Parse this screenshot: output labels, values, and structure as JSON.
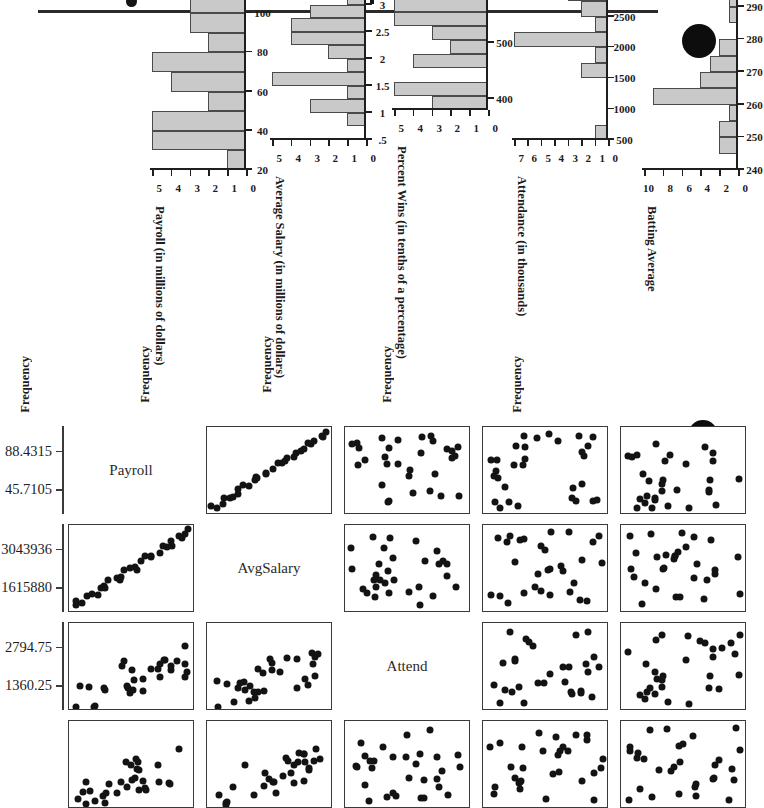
{
  "page": {
    "rule_present": true,
    "marks": [
      "page-edge-dot",
      "page-edge-dot-2",
      "stray-ink-dot"
    ]
  },
  "histograms": {
    "y_axis_title": "Frequency",
    "panels": [
      {
        "id": "payroll",
        "x_title": "Payroll (in millions of dollars)",
        "x_ticks": [
          20,
          40,
          60,
          80,
          100,
          120
        ],
        "x_min": 20,
        "x_max": 120,
        "y_ticks": [
          0,
          1,
          2,
          3,
          4,
          5
        ],
        "y_max": 5,
        "bin_width": 10,
        "bins": [
          {
            "from": 20,
            "to": 30,
            "count": 1
          },
          {
            "from": 30,
            "to": 40,
            "count": 5
          },
          {
            "from": 40,
            "to": 50,
            "count": 5
          },
          {
            "from": 50,
            "to": 60,
            "count": 2
          },
          {
            "from": 60,
            "to": 70,
            "count": 4
          },
          {
            "from": 70,
            "to": 80,
            "count": 5
          },
          {
            "from": 80,
            "to": 90,
            "count": 2
          },
          {
            "from": 90,
            "to": 100,
            "count": 3
          },
          {
            "from": 100,
            "to": 110,
            "count": 3
          },
          {
            "from": 110,
            "to": 120,
            "count": 0
          }
        ]
      },
      {
        "id": "avgsalary",
        "x_title": "Average Salary (in millions of dollars)",
        "x_ticks": [
          ".5",
          "1",
          "1.5",
          "2",
          "2.5",
          "3",
          "3.5",
          "4",
          "4.5"
        ],
        "x_min": 0.5,
        "x_max": 4.5,
        "y_ticks": [
          0,
          1,
          2,
          3,
          4,
          5
        ],
        "y_max": 5,
        "bin_width": 0.25,
        "bins": [
          {
            "from": 0.5,
            "to": 0.75,
            "count": 0
          },
          {
            "from": 0.75,
            "to": 1.0,
            "count": 1
          },
          {
            "from": 1.0,
            "to": 1.25,
            "count": 3
          },
          {
            "from": 1.25,
            "to": 1.5,
            "count": 1
          },
          {
            "from": 1.5,
            "to": 1.75,
            "count": 5
          },
          {
            "from": 1.75,
            "to": 2.0,
            "count": 1
          },
          {
            "from": 2.0,
            "to": 2.25,
            "count": 2
          },
          {
            "from": 2.25,
            "to": 2.5,
            "count": 4
          },
          {
            "from": 2.5,
            "to": 2.75,
            "count": 4
          },
          {
            "from": 2.75,
            "to": 3.0,
            "count": 3
          },
          {
            "from": 3.0,
            "to": 3.25,
            "count": 1
          },
          {
            "from": 3.25,
            "to": 3.5,
            "count": 2
          },
          {
            "from": 3.5,
            "to": 3.75,
            "count": 1
          },
          {
            "from": 3.75,
            "to": 4.0,
            "count": 1
          },
          {
            "from": 4.0,
            "to": 4.25,
            "count": 1
          },
          {
            "from": 4.25,
            "to": 4.5,
            "count": 0
          }
        ]
      },
      {
        "id": "percentwins",
        "x_title": "Percent Wins (in tenths of a percentage)",
        "x_ticks": [
          400,
          500,
          600,
          700,
          800
        ],
        "x_min": 380,
        "x_max": 800,
        "y_ticks": [
          0,
          1,
          2,
          3,
          4,
          5
        ],
        "y_max": 5,
        "bin_width": 25,
        "bins": [
          {
            "from": 380,
            "to": 405,
            "count": 3
          },
          {
            "from": 405,
            "to": 430,
            "count": 5
          },
          {
            "from": 430,
            "to": 455,
            "count": 0
          },
          {
            "from": 455,
            "to": 480,
            "count": 4
          },
          {
            "from": 480,
            "to": 505,
            "count": 2
          },
          {
            "from": 505,
            "to": 530,
            "count": 3
          },
          {
            "from": 530,
            "to": 555,
            "count": 5
          },
          {
            "from": 555,
            "to": 580,
            "count": 5
          },
          {
            "from": 580,
            "to": 605,
            "count": 1
          },
          {
            "from": 605,
            "to": 630,
            "count": 1
          },
          {
            "from": 630,
            "to": 655,
            "count": 0
          },
          {
            "from": 655,
            "to": 680,
            "count": 0
          },
          {
            "from": 680,
            "to": 705,
            "count": 0
          },
          {
            "from": 705,
            "to": 730,
            "count": 1
          },
          {
            "from": 730,
            "to": 755,
            "count": 0
          },
          {
            "from": 755,
            "to": 780,
            "count": 0
          },
          {
            "from": 780,
            "to": 800,
            "count": 0
          }
        ]
      },
      {
        "id": "attendance",
        "x_title": "Attendance (in thousands)",
        "x_ticks": [
          500,
          1000,
          1500,
          2000,
          2500,
          3000,
          3500,
          4000
        ],
        "x_min": 500,
        "x_max": 4000,
        "y_ticks": [
          0,
          1,
          2,
          3,
          4,
          5,
          6,
          7
        ],
        "y_max": 7,
        "bin_width": 250,
        "bins": [
          {
            "from": 500,
            "to": 750,
            "count": 1
          },
          {
            "from": 750,
            "to": 1000,
            "count": 0
          },
          {
            "from": 1000,
            "to": 1250,
            "count": 0
          },
          {
            "from": 1250,
            "to": 1500,
            "count": 0
          },
          {
            "from": 1500,
            "to": 1750,
            "count": 2
          },
          {
            "from": 1750,
            "to": 2000,
            "count": 1
          },
          {
            "from": 2000,
            "to": 2250,
            "count": 7
          },
          {
            "from": 2250,
            "to": 2500,
            "count": 1
          },
          {
            "from": 2500,
            "to": 2750,
            "count": 2
          },
          {
            "from": 2750,
            "to": 3000,
            "count": 3
          },
          {
            "from": 3000,
            "to": 3250,
            "count": 4
          },
          {
            "from": 3250,
            "to": 3500,
            "count": 6
          },
          {
            "from": 3500,
            "to": 3750,
            "count": 1
          },
          {
            "from": 3750,
            "to": 4000,
            "count": 1
          }
        ]
      },
      {
        "id": "battingaverage",
        "x_title": "Batting Average",
        "x_ticks": [
          240,
          250,
          260,
          270,
          280,
          290,
          300
        ],
        "x_min": 240,
        "x_max": 300,
        "y_ticks": [
          0,
          2,
          4,
          6,
          8,
          10
        ],
        "y_max": 10,
        "bin_width": 5,
        "bins": [
          {
            "from": 240,
            "to": 245,
            "count": 0
          },
          {
            "from": 245,
            "to": 250,
            "count": 2
          },
          {
            "from": 250,
            "to": 255,
            "count": 2
          },
          {
            "from": 255,
            "to": 260,
            "count": 1
          },
          {
            "from": 260,
            "to": 265,
            "count": 9
          },
          {
            "from": 265,
            "to": 270,
            "count": 4
          },
          {
            "from": 270,
            "to": 275,
            "count": 3
          },
          {
            "from": 275,
            "to": 280,
            "count": 2
          },
          {
            "from": 280,
            "to": 285,
            "count": 0
          },
          {
            "from": 285,
            "to": 290,
            "count": 1
          },
          {
            "from": 290,
            "to": 295,
            "count": 1
          },
          {
            "from": 295,
            "to": 300,
            "count": 0
          }
        ]
      }
    ]
  },
  "chart_data": {
    "type": "scatter",
    "variables": [
      "Payroll",
      "AvgSalary",
      "Attend",
      "BattingAvg"
    ],
    "axis_ranges": {
      "Payroll": {
        "ticks": [
          "45.7105",
          "88.4315"
        ]
      },
      "AvgSalary": {
        "ticks": [
          "1615880",
          "3043936"
        ]
      },
      "Attend": {
        "ticks": [
          "1360.25",
          "2794.75"
        ]
      },
      "BattingAvg": {
        "ticks": []
      }
    },
    "grid": false,
    "legend": "none",
    "n_points": 30,
    "pairs": {
      "payroll_vs_avgsalary": {
        "x": [
          0.06,
          0.12,
          0.16,
          0.19,
          0.21,
          0.23,
          0.25,
          0.27,
          0.3,
          0.32,
          0.35,
          0.38,
          0.41,
          0.44,
          0.47,
          0.5,
          0.53,
          0.56,
          0.58,
          0.61,
          0.64,
          0.67,
          0.7,
          0.74,
          0.78,
          0.82,
          0.87,
          0.9,
          0.93,
          0.95
        ],
        "y": [
          0.11,
          0.17,
          0.2,
          0.24,
          0.26,
          0.28,
          0.3,
          0.32,
          0.35,
          0.37,
          0.4,
          0.43,
          0.46,
          0.49,
          0.52,
          0.55,
          0.58,
          0.6,
          0.63,
          0.66,
          0.69,
          0.72,
          0.75,
          0.79,
          0.83,
          0.88,
          0.92,
          0.93,
          0.94,
          0.95
        ]
      },
      "attend_vs_payroll": {
        "x": [
          0.05,
          0.13,
          0.15,
          0.16,
          0.17,
          0.18,
          0.22,
          0.25,
          0.28,
          0.31,
          0.34,
          0.37,
          0.4,
          0.43,
          0.46,
          0.49,
          0.52,
          0.55,
          0.58,
          0.61,
          0.64,
          0.67,
          0.7,
          0.73,
          0.76,
          0.8,
          0.84,
          0.88,
          0.92,
          0.96
        ],
        "y": [
          0.38,
          0.45,
          0.28,
          0.35,
          0.52,
          0.15,
          0.6,
          0.42,
          0.32,
          0.33,
          0.7,
          0.55,
          0.62,
          0.78,
          0.68,
          0.58,
          0.72,
          0.38,
          0.66,
          0.63,
          0.59,
          0.74,
          0.61,
          0.67,
          0.55,
          0.7,
          0.64,
          0.73,
          0.69,
          0.62
        ]
      }
    }
  },
  "scatter_matrix": {
    "diagonal_labels": [
      "Payroll",
      "AvgSalary",
      "Attend"
    ],
    "axis_labels": {
      "payroll_high": "88.4315",
      "payroll_low": "45.7105",
      "avgsalary_high": "3043936",
      "avgsalary_low": "1615880",
      "attend_high": "2794.75",
      "attend_low": "1360.25"
    }
  }
}
